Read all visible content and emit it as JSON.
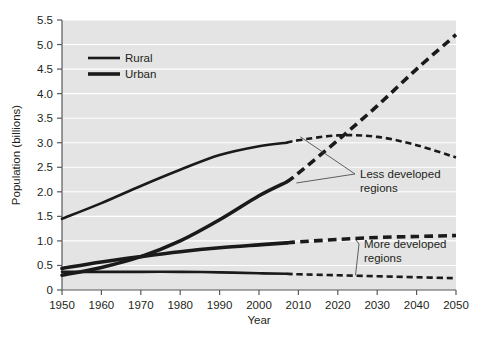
{
  "chart_data": {
    "type": "line",
    "title": "",
    "xlabel": "Year",
    "ylabel": "Population (billions)",
    "xlim": [
      1950,
      2050
    ],
    "ylim": [
      0,
      5.5
    ],
    "xticks": [
      1950,
      1960,
      1970,
      1980,
      1990,
      2000,
      2010,
      2020,
      2030,
      2040,
      2050
    ],
    "xtick_labels": [
      "1950",
      "1960",
      "1970",
      "1980",
      "1990",
      "2000",
      "2010",
      "2020",
      "2030",
      "2040",
      "2050"
    ],
    "yticks": [
      0,
      0.5,
      1.0,
      1.5,
      2.0,
      2.5,
      3.0,
      3.5,
      4.0,
      4.5,
      5.0,
      5.5
    ],
    "ytick_labels": [
      "0",
      "0.5",
      "1.0",
      "1.5",
      "2.0",
      "2.5",
      "3.0",
      "3.5",
      "4.0",
      "4.5",
      "5.0",
      "5.5"
    ],
    "grid": "horizontal-white",
    "plot_background": "#e4e4e4",
    "line_color": "#1a1a1a",
    "projection_start_year": 2007,
    "legend": {
      "position": "upper-left-inside",
      "entries": [
        {
          "label": "Rural",
          "style": "solid",
          "width": 2.6
        },
        {
          "label": "Urban",
          "style": "solid",
          "width": 3.6
        }
      ]
    },
    "annotations": [
      {
        "text_line1": "Less developed",
        "text_line2": "regions",
        "text_x": 2027,
        "text_y": 2.05,
        "points_to": [
          {
            "x": 2010.5,
            "y": 3.12
          },
          {
            "x": 2009.5,
            "y": 2.18
          }
        ]
      },
      {
        "text_line1": "More developed",
        "text_line2": "regions",
        "text_x": 2028,
        "text_y": 0.72,
        "points_to": [
          {
            "x": 2024.5,
            "y": 1.03
          },
          {
            "x": 2024.5,
            "y": 0.3
          }
        ]
      }
    ],
    "series": [
      {
        "name": "Less developed regions - Rural",
        "region": "Less developed",
        "type": "Rural",
        "style": "solid-then-dashed",
        "line_width": 2.6,
        "x": [
          1950,
          1960,
          1970,
          1980,
          1990,
          2000,
          2007,
          2010,
          2020,
          2030,
          2040,
          2050
        ],
        "y": [
          1.45,
          1.77,
          2.12,
          2.45,
          2.75,
          2.93,
          3.0,
          3.05,
          3.15,
          3.12,
          2.95,
          2.7
        ]
      },
      {
        "name": "Less developed regions - Urban",
        "region": "Less developed",
        "type": "Urban",
        "style": "solid-then-dashed",
        "line_width": 3.6,
        "x": [
          1950,
          1960,
          1970,
          1980,
          1990,
          2000,
          2007,
          2010,
          2020,
          2030,
          2040,
          2050
        ],
        "y": [
          0.3,
          0.46,
          0.68,
          1.0,
          1.43,
          1.92,
          2.2,
          2.38,
          3.05,
          3.75,
          4.5,
          5.2
        ]
      },
      {
        "name": "More developed regions - Urban",
        "region": "More developed",
        "type": "Urban",
        "style": "solid-then-dashed",
        "line_width": 3.6,
        "x": [
          1950,
          1960,
          1970,
          1980,
          1990,
          2000,
          2007,
          2010,
          2020,
          2030,
          2040,
          2050
        ],
        "y": [
          0.44,
          0.57,
          0.68,
          0.78,
          0.86,
          0.92,
          0.96,
          0.98,
          1.03,
          1.07,
          1.09,
          1.11
        ]
      },
      {
        "name": "More developed regions - Rural",
        "region": "More developed",
        "type": "Rural",
        "style": "solid-then-dashed",
        "line_width": 2.6,
        "x": [
          1950,
          1960,
          1970,
          1980,
          1990,
          2000,
          2007,
          2010,
          2020,
          2030,
          2040,
          2050
        ],
        "y": [
          0.37,
          0.37,
          0.37,
          0.37,
          0.36,
          0.34,
          0.33,
          0.32,
          0.3,
          0.28,
          0.26,
          0.24
        ]
      }
    ]
  }
}
